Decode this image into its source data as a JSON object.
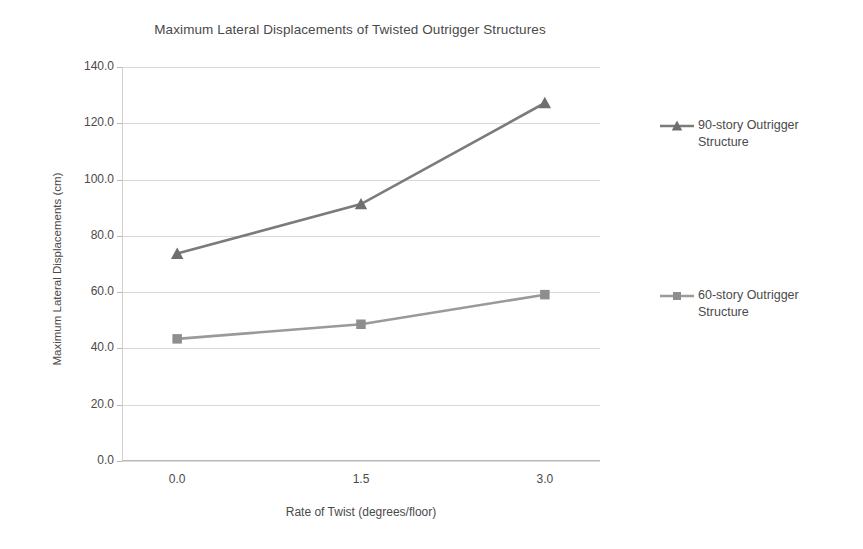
{
  "chart_data": {
    "type": "line",
    "title": "Maximum Lateral Displacements of Twisted Outrigger Structures",
    "xlabel": "Rate of Twist (degrees/floor)",
    "ylabel": "Maximum Lateral Displacements (cm)",
    "x": [
      0.0,
      1.5,
      3.0
    ],
    "xtick_labels": [
      "0.0",
      "1.5",
      "3.0"
    ],
    "ytick_labels": [
      "0.0",
      "20.0",
      "40.0",
      "60.0",
      "80.0",
      "100.0",
      "120.0",
      "140.0"
    ],
    "yticks": [
      0,
      20,
      40,
      60,
      80,
      100,
      120,
      140
    ],
    "ylim": [
      0,
      140
    ],
    "xlim": [
      -0.45,
      3.45
    ],
    "grid": "horizontal",
    "legend_position": "right",
    "series": [
      {
        "name": "90-story Outrigger Structure",
        "values": [
          73.7,
          91.3,
          127.2
        ],
        "marker": "triangle",
        "color": "#7b7b7b"
      },
      {
        "name": "60-story Outrigger Structure",
        "values": [
          43.4,
          48.6,
          59.1
        ],
        "marker": "square",
        "color": "#9a9a9a"
      }
    ]
  },
  "legend": {
    "entries": [
      {
        "label_line1": "90-story Outrigger",
        "label_line2": "Structure"
      },
      {
        "label_line1": "60-story Outrigger",
        "label_line2": "Structure"
      }
    ]
  }
}
